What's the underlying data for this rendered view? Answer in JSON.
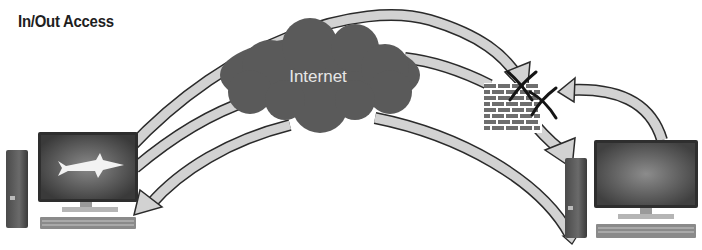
{
  "diagram": {
    "title": "In/Out Access",
    "cloud": {
      "label": "Internet",
      "icon": "cloud-icon"
    },
    "firewall": {
      "icon": "brick-wall-icon",
      "blocked_marks": 2
    },
    "nodes": [
      {
        "id": "left-computer",
        "icon": "desktop-computer-icon",
        "screen_icon": "shark-icon"
      },
      {
        "id": "right-computer",
        "icon": "desktop-computer-icon"
      }
    ],
    "flows": [
      {
        "from": "left-computer",
        "to": "firewall",
        "via": "over-internet",
        "blocked": true
      },
      {
        "from": "left-computer",
        "to": "firewall",
        "via": "internet",
        "blocked": false
      },
      {
        "from": "internet",
        "to": "left-computer",
        "blocked": false
      },
      {
        "from": "internet",
        "to": "right-computer",
        "blocked": false
      },
      {
        "from": "firewall",
        "to": "right-computer",
        "blocked": false
      },
      {
        "from": "right-computer",
        "to": "firewall",
        "blocked": true
      }
    ],
    "colors": {
      "arrow_fill": "#d2d2d2",
      "arrow_stroke": "#2a2a2a",
      "cloud": "#5a5a5a",
      "brick": "#6e6e6e"
    }
  }
}
